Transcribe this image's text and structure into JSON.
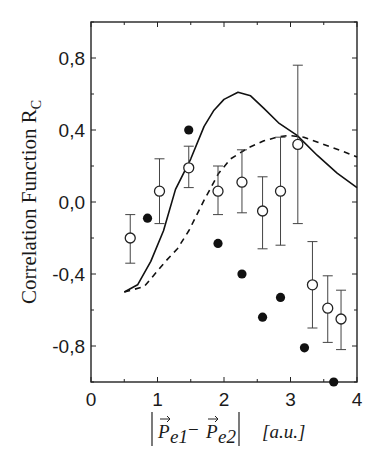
{
  "chart_data": {
    "type": "scatter",
    "title": "",
    "xlabel": "|P_e1 - P_e2|  [a.u.]",
    "ylabel": "Correlation Function R_C",
    "xlim": [
      0,
      4
    ],
    "ylim": [
      -1.0,
      1.0
    ],
    "x_ticks": [
      "0",
      "1",
      "2",
      "3",
      "4"
    ],
    "y_ticks": [
      "0,8",
      "0,4",
      "0,0",
      "-0,4",
      "-0,8"
    ],
    "y_tick_values": [
      0.8,
      0.4,
      0.0,
      -0.4,
      -0.8
    ],
    "grid": false,
    "legend": null,
    "series": [
      {
        "name": "open circles (with error bars)",
        "marker": "open-circle",
        "points": [
          {
            "x": 0.59,
            "y": -0.2,
            "err_low": -0.34,
            "err_high": -0.07
          },
          {
            "x": 1.03,
            "y": 0.06,
            "err_low": -0.12,
            "err_high": 0.24
          },
          {
            "x": 1.47,
            "y": 0.19,
            "err_low": 0.08,
            "err_high": 0.31
          },
          {
            "x": 1.91,
            "y": 0.06,
            "err_low": -0.07,
            "err_high": 0.2
          },
          {
            "x": 2.27,
            "y": 0.11,
            "err_low": -0.06,
            "err_high": 0.29
          },
          {
            "x": 2.58,
            "y": -0.05,
            "err_low": -0.26,
            "err_high": 0.14
          },
          {
            "x": 2.85,
            "y": 0.06,
            "err_low": -0.24,
            "err_high": 0.36
          },
          {
            "x": 3.11,
            "y": 0.32,
            "err_low": -0.12,
            "err_high": 0.76
          },
          {
            "x": 3.33,
            "y": -0.46,
            "err_low": -0.7,
            "err_high": -0.22
          },
          {
            "x": 3.56,
            "y": -0.59,
            "err_low": -0.78,
            "err_high": -0.41
          },
          {
            "x": 3.76,
            "y": -0.65,
            "err_low": -0.82,
            "err_high": -0.49
          }
        ]
      },
      {
        "name": "filled circles",
        "marker": "filled-circle",
        "points": [
          {
            "x": 0.85,
            "y": -0.09
          },
          {
            "x": 1.47,
            "y": 0.4
          },
          {
            "x": 1.91,
            "y": -0.23
          },
          {
            "x": 2.27,
            "y": -0.4
          },
          {
            "x": 2.58,
            "y": -0.64
          },
          {
            "x": 2.85,
            "y": -0.53
          },
          {
            "x": 3.21,
            "y": -0.81
          },
          {
            "x": 3.65,
            "y": -1.0
          }
        ]
      },
      {
        "name": "solid curve",
        "style": "solid",
        "x": [
          0.5,
          0.7,
          0.9,
          1.09,
          1.27,
          1.5,
          1.7,
          1.85,
          2.0,
          2.21,
          2.4,
          2.6,
          2.82,
          3.1,
          3.4,
          3.7,
          4.0
        ],
        "y": [
          -0.5,
          -0.46,
          -0.33,
          -0.16,
          0.07,
          0.24,
          0.42,
          0.51,
          0.57,
          0.61,
          0.59,
          0.52,
          0.44,
          0.37,
          0.26,
          0.16,
          0.08
        ]
      },
      {
        "name": "dashed curve",
        "style": "dashed",
        "x": [
          0.5,
          0.8,
          1.12,
          1.3,
          1.47,
          1.7,
          1.92,
          2.1,
          2.36,
          2.6,
          2.8,
          2.97,
          3.2,
          3.5,
          3.8,
          4.0
        ],
        "y": [
          -0.5,
          -0.47,
          -0.33,
          -0.26,
          -0.16,
          0.01,
          0.16,
          0.24,
          0.3,
          0.34,
          0.36,
          0.37,
          0.36,
          0.32,
          0.28,
          0.25
        ]
      }
    ]
  },
  "axes": {
    "ylabel_main": "Correlation Function R",
    "ylabel_sub": "C",
    "xlabel_parts": {
      "p1": "P",
      "p1_sub": "e1",
      "minus": "−",
      "p2": "P",
      "p2_sub": "e2",
      "units": "[a.u.]"
    }
  }
}
